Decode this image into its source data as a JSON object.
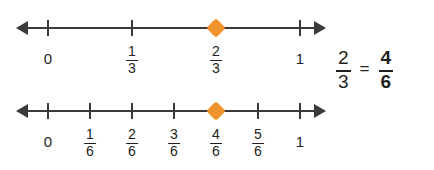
{
  "colors": {
    "background": "#ffffff",
    "line": "#3a3a3a",
    "text": "#231f20",
    "marker": "#f0922e"
  },
  "chart_data": {
    "type": "line",
    "title": "",
    "xlabel": "",
    "ylabel": "",
    "grid": false,
    "legend": null,
    "charts": [
      {
        "name": "thirds-number-line",
        "denominator": 3,
        "xlim": [
          0,
          1
        ],
        "tick_values": [
          0,
          0.3333,
          0.6667,
          1
        ],
        "tick_labels": [
          "0",
          "1/3",
          "2/3",
          "1"
        ],
        "marked_value": 0.6667,
        "marked_label": "2/3"
      },
      {
        "name": "sixths-number-line",
        "denominator": 6,
        "xlim": [
          0,
          1
        ],
        "tick_values": [
          0,
          0.1667,
          0.3333,
          0.5,
          0.6667,
          0.8333,
          1
        ],
        "tick_labels": [
          "0",
          "1/6",
          "2/6",
          "3/6",
          "4/6",
          "5/6",
          "1"
        ],
        "marked_value": 0.6667,
        "marked_label": "4/6"
      }
    ]
  },
  "numberlines": [
    {
      "id": "thirds",
      "ticks": [
        {
          "pos_px": 48,
          "type": "whole",
          "label": "0"
        },
        {
          "pos_px": 132,
          "type": "fraction",
          "numerator": "1",
          "denominator": "3",
          "label": "1/3"
        },
        {
          "pos_px": 216,
          "type": "fraction",
          "numerator": "2",
          "denominator": "3",
          "label": "2/3",
          "marked": true
        },
        {
          "pos_px": 300,
          "type": "whole",
          "label": "1"
        }
      ]
    },
    {
      "id": "sixths",
      "ticks": [
        {
          "pos_px": 48,
          "type": "whole",
          "label": "0"
        },
        {
          "pos_px": 90,
          "type": "fraction",
          "numerator": "1",
          "denominator": "6",
          "label": "1/6"
        },
        {
          "pos_px": 132,
          "type": "fraction",
          "numerator": "2",
          "denominator": "6",
          "label": "2/6"
        },
        {
          "pos_px": 174,
          "type": "fraction",
          "numerator": "3",
          "denominator": "6",
          "label": "3/6"
        },
        {
          "pos_px": 216,
          "type": "fraction",
          "numerator": "4",
          "denominator": "6",
          "label": "4/6",
          "marked": true
        },
        {
          "pos_px": 258,
          "type": "fraction",
          "numerator": "5",
          "denominator": "6",
          "label": "5/6"
        },
        {
          "pos_px": 300,
          "type": "whole",
          "label": "1"
        }
      ]
    }
  ],
  "equation": {
    "left": {
      "numerator": "2",
      "denominator": "3",
      "bold": false
    },
    "operator": "=",
    "right": {
      "numerator": "4",
      "denominator": "6",
      "bold": true
    },
    "text": "2/3 = 4/6"
  }
}
